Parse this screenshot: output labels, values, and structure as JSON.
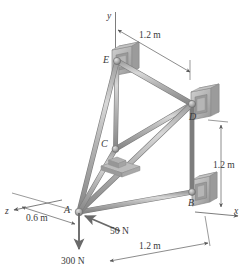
{
  "figure": {
    "axes": [
      {
        "name": "y-axis",
        "label": "y"
      },
      {
        "name": "x-axis",
        "label": "x"
      },
      {
        "name": "z-axis",
        "label": "z"
      }
    ],
    "joints": [
      {
        "id": "E",
        "label": "E",
        "support": "ball-and-socket-wall-bracket"
      },
      {
        "id": "D",
        "label": "D",
        "support": "ball-and-socket-wall-bracket"
      },
      {
        "id": "C",
        "label": "C",
        "support": "ball-and-socket-base-plate"
      },
      {
        "id": "B",
        "label": "B",
        "support": "ball-and-socket-wall-bracket"
      },
      {
        "id": "A",
        "label": "A",
        "support": "free-loaded-joint"
      }
    ],
    "dimensions": [
      {
        "name": "dim-top",
        "label": "1.2 m"
      },
      {
        "name": "dim-right",
        "label": "1.2 m"
      },
      {
        "name": "dim-bottom",
        "label": "1.2 m"
      },
      {
        "name": "dim-left",
        "label": "0.6 m"
      }
    ],
    "forces": [
      {
        "name": "force-vertical",
        "label": "300 N",
        "direction": "down"
      },
      {
        "name": "force-diagonal",
        "label": "50 N",
        "direction": "toward-lower-left"
      }
    ],
    "colors": {
      "member_light": "#c9c9c9",
      "member_mid": "#a8a8a8",
      "member_dark": "#7d7d7d",
      "bracket_face": "#b8b8b8",
      "bracket_edge": "#8f8f8f",
      "bracket_inner": "#9a9a9a",
      "line": "#6e6e6e",
      "text": "#3a3a3a"
    }
  }
}
